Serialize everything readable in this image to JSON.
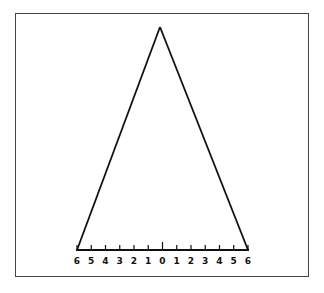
{
  "diagram": {
    "type": "triangle-with-scale",
    "apex": {
      "x": 160,
      "y": 27
    },
    "base_left": {
      "x": 77,
      "y": 250
    },
    "base_right": {
      "x": 248,
      "y": 250
    },
    "scale_labels": [
      "6",
      "5",
      "4",
      "3",
      "2",
      "1",
      "0",
      "1",
      "2",
      "3",
      "4",
      "5",
      "6"
    ],
    "line_color": "#111111",
    "frame_color": "#444444"
  }
}
